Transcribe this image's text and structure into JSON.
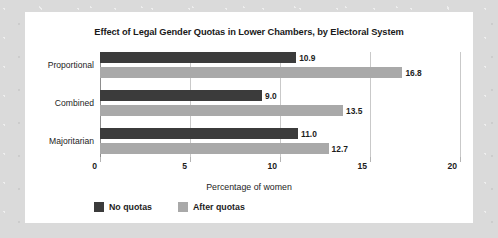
{
  "chart_data": {
    "type": "bar",
    "orientation": "horizontal",
    "title": "Effect of Legal Gender Quotas in Lower Chambers, by Electoral System",
    "xlabel": "Percentage of women",
    "ylabel": "",
    "categories": [
      "Proportional",
      "Combined",
      "Majoritarian"
    ],
    "series": [
      {
        "name": "No quotas",
        "color": "#3b3b3b",
        "values": [
          10.9,
          9.0,
          11.0
        ],
        "labels": [
          "10.9",
          "9.0",
          "11.0"
        ]
      },
      {
        "name": "After quotas",
        "color": "#a9a9a9",
        "values": [
          16.8,
          13.5,
          12.7
        ],
        "labels": [
          "16.8",
          "13.5",
          "12.7"
        ]
      }
    ],
    "xlim": [
      0,
      20
    ],
    "xticks": [
      0,
      5,
      10,
      15,
      20
    ],
    "xtick_labels": [
      "0",
      "5",
      "10",
      "15",
      "20"
    ],
    "grid": true,
    "grid_axis": "x",
    "legend_position": "bottom-left",
    "data_labels": true
  },
  "colors": {
    "page_background": "#dadada",
    "panel_background": "#ffffff",
    "series_no_quotas": "#3b3b3b",
    "series_after_quotas": "#a9a9a9",
    "gridline": "#c9c9c9",
    "axis": "#8d8d8d",
    "text": "#1d1d1d"
  }
}
